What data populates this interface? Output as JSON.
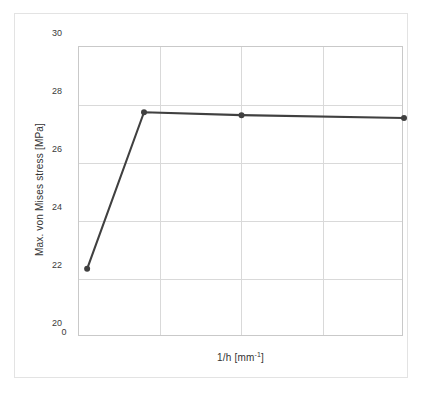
{
  "chart_data": {
    "type": "line",
    "title": "",
    "xlabel": "1/h [mm-1]",
    "xlabel_base": "1/h [mm",
    "xlabel_sup": "-1",
    "xlabel_tail": "]",
    "ylabel": "Max. von Mises stress [MPa]",
    "xlim": [
      0,
      20
    ],
    "ylim": [
      20,
      30
    ],
    "grid": true,
    "legend": "none",
    "xticks": [
      "0",
      "5",
      "10",
      "15",
      "20"
    ],
    "xtick_values": [
      0,
      5,
      10,
      15,
      20
    ],
    "yticks": [
      "20",
      "22",
      "24",
      "26",
      "28",
      "30"
    ],
    "ytick_values": [
      20,
      22,
      24,
      26,
      28,
      30
    ],
    "series": [
      {
        "name": "Max. von Mises stress",
        "color": "#404040",
        "marker": "circle",
        "x": [
          0.5,
          4,
          10,
          20
        ],
        "y": [
          22.35,
          27.75,
          27.65,
          27.55
        ]
      }
    ]
  }
}
